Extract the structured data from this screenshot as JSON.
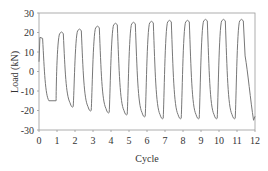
{
  "chart_data": {
    "type": "line",
    "title": "",
    "xlabel": "Cycle",
    "ylabel": "Load (kN)",
    "xlim": [
      0,
      12
    ],
    "ylim": [
      -30,
      30
    ],
    "xticks": [
      0,
      1,
      2,
      3,
      4,
      5,
      6,
      7,
      8,
      9,
      10,
      11,
      12
    ],
    "yticks": [
      -30,
      -20,
      -10,
      0,
      10,
      20,
      30
    ],
    "grid": false,
    "legend": null,
    "series": [
      {
        "name": "Load",
        "color": "#777777",
        "cycle_peaks": [
          17.5,
          20.5,
          22,
          23.5,
          25,
          25.5,
          26,
          26.5,
          26.5,
          27,
          27,
          27
        ],
        "cycle_troughs": [
          -15,
          -18,
          -20,
          -21,
          -22,
          -23,
          -24,
          -24,
          -24,
          -24,
          -24,
          -25
        ]
      }
    ]
  }
}
